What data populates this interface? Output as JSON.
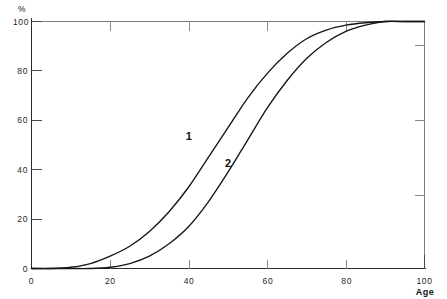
{
  "chart_data": {
    "type": "line",
    "title": "",
    "subtitle": "",
    "xlabel": "Age",
    "ylabel": "%",
    "xlim": [
      0,
      100
    ],
    "ylim": [
      0,
      100
    ],
    "grid": false,
    "legend_position": "inline-annotations",
    "x_ticks": [
      0,
      20,
      40,
      60,
      80,
      100
    ],
    "x_tick_labels": [
      "0",
      "20",
      "40",
      "60",
      "80",
      "100"
    ],
    "y_ticks": [
      0,
      20,
      40,
      60,
      80,
      100
    ],
    "y_tick_labels": [
      "0",
      "20",
      "40",
      "60",
      "80",
      "100"
    ],
    "x": [
      0,
      5,
      10,
      15,
      20,
      25,
      30,
      35,
      40,
      45,
      50,
      55,
      60,
      65,
      70,
      75,
      80,
      85,
      90,
      95,
      100
    ],
    "series": [
      {
        "name": "1",
        "label": "1",
        "color": "#151515",
        "values": [
          0,
          0,
          0.5,
          2,
          5,
          9,
          15,
          23,
          33,
          45,
          57,
          69,
          79,
          87,
          93,
          96.5,
          98.5,
          99.5,
          100,
          100,
          100
        ]
      },
      {
        "name": "2",
        "label": "2",
        "color": "#151515",
        "values": [
          0,
          0,
          0,
          0,
          0.5,
          2,
          5,
          10,
          17,
          27,
          39,
          52,
          65,
          76,
          85,
          91.5,
          96,
          98.5,
          100,
          100,
          100
        ]
      }
    ],
    "annotations": [
      {
        "text": "1",
        "x": 40,
        "y": 52,
        "style": "bold"
      },
      {
        "text": "2",
        "x": 50,
        "y": 41,
        "style": "bold"
      }
    ]
  },
  "axes": {
    "y_axis_unit": "%",
    "x_axis_title": "Age"
  }
}
